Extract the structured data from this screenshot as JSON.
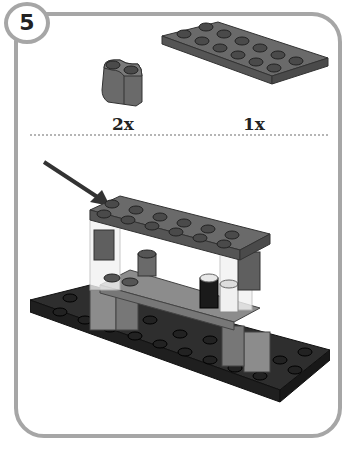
{
  "step": {
    "number": "5"
  },
  "parts_needed": [
    {
      "name": "curved-brick-1x2",
      "quantity": "2x"
    },
    {
      "name": "plate-2x6",
      "quantity": "1x"
    }
  ],
  "assembly": {
    "callout": "arrow pointing to newly added 2x6 plate"
  },
  "colors": {
    "frame": "#a6a6a6",
    "dark_gray_part": "#5f5f5f",
    "black_base": "#2e2e2e",
    "light_gray_part": "#8c8c8c"
  }
}
